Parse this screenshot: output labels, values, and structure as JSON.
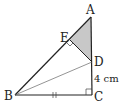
{
  "diagram": {
    "type": "geometry-triangle",
    "points": {
      "A": {
        "label": "A",
        "x": 91,
        "y": 17
      },
      "B": {
        "label": "B",
        "x": 15,
        "y": 95
      },
      "C": {
        "label": "C",
        "x": 92,
        "y": 95
      },
      "D": {
        "label": "D",
        "x": 92,
        "y": 62
      },
      "E": {
        "label": "E",
        "x": 70,
        "y": 40
      }
    },
    "labels": {
      "A": "A",
      "B": "B",
      "C": "C",
      "D": "D",
      "E": "E",
      "dc_length": "4 cm"
    },
    "segments": [
      "AB",
      "BC",
      "CA",
      "BD",
      "DE"
    ],
    "shaded_region": "AED",
    "right_angles": [
      "E",
      "C"
    ],
    "equal_marks": [
      "BC"
    ],
    "colors": {
      "line": "#222222",
      "thin_line": "#555555",
      "shade": "#c8c8c8"
    }
  }
}
